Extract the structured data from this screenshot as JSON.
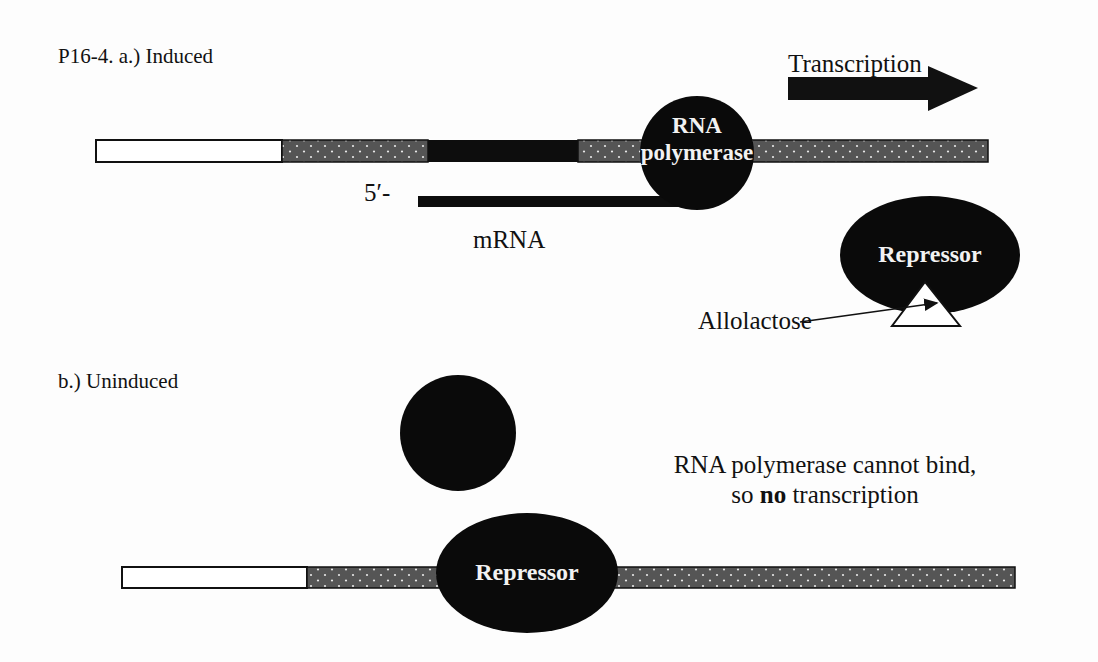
{
  "panel_a": {
    "title": "P16-4. a.) Induced",
    "transcription_label": "Transcription",
    "polymerase_label_line1": "RNA",
    "polymerase_label_line2": "polymerase",
    "five_prime_label": "5′-",
    "mrna_label": "mRNA",
    "repressor_label": "Repressor",
    "inducer_label": "Allolactose"
  },
  "panel_b": {
    "title": "b.) Uninduced",
    "repressor_label": "Repressor",
    "note_line1": "RNA polymerase cannot bind,",
    "note_line2_pre": "so ",
    "note_line2_bold": "no",
    "note_line2_post": " transcription"
  },
  "colors": {
    "dna_dotted": "#555555",
    "operator_black": "#0d0d0d",
    "protein_black": "#0a0a0a",
    "promoter_white": "#ffffff"
  }
}
